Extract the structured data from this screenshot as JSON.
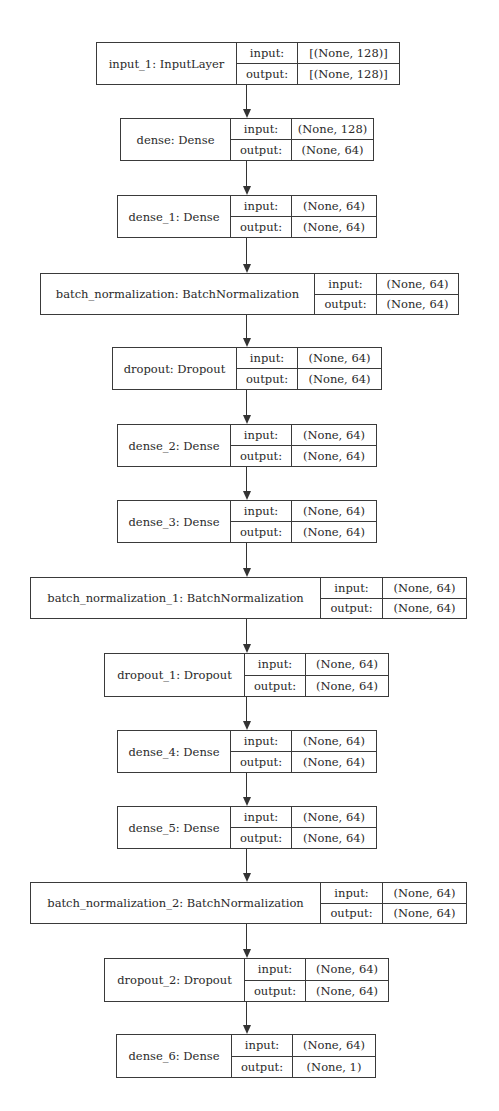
{
  "diagram": {
    "type": "keras_model_plot",
    "port_labels": {
      "input": "input:",
      "output": "output:"
    },
    "nodes": [
      {
        "id": "input_1",
        "label": "input_1: InputLayer",
        "input_shape": "[(None, 128)]",
        "output_shape": "[(None, 128)]"
      },
      {
        "id": "dense",
        "label": "dense: Dense",
        "input_shape": "(None, 128)",
        "output_shape": "(None, 64)"
      },
      {
        "id": "dense_1",
        "label": "dense_1: Dense",
        "input_shape": "(None, 64)",
        "output_shape": "(None, 64)"
      },
      {
        "id": "batch_normalization",
        "label": "batch_normalization: BatchNormalization",
        "input_shape": "(None, 64)",
        "output_shape": "(None, 64)"
      },
      {
        "id": "dropout",
        "label": "dropout: Dropout",
        "input_shape": "(None, 64)",
        "output_shape": "(None, 64)"
      },
      {
        "id": "dense_2",
        "label": "dense_2: Dense",
        "input_shape": "(None, 64)",
        "output_shape": "(None, 64)"
      },
      {
        "id": "dense_3",
        "label": "dense_3: Dense",
        "input_shape": "(None, 64)",
        "output_shape": "(None, 64)"
      },
      {
        "id": "batch_normalization_1",
        "label": "batch_normalization_1: BatchNormalization",
        "input_shape": "(None, 64)",
        "output_shape": "(None, 64)"
      },
      {
        "id": "dropout_1",
        "label": "dropout_1: Dropout",
        "input_shape": "(None, 64)",
        "output_shape": "(None, 64)"
      },
      {
        "id": "dense_4",
        "label": "dense_4: Dense",
        "input_shape": "(None, 64)",
        "output_shape": "(None, 64)"
      },
      {
        "id": "dense_5",
        "label": "dense_5: Dense",
        "input_shape": "(None, 64)",
        "output_shape": "(None, 64)"
      },
      {
        "id": "batch_normalization_2",
        "label": "batch_normalization_2: BatchNormalization",
        "input_shape": "(None, 64)",
        "output_shape": "(None, 64)"
      },
      {
        "id": "dropout_2",
        "label": "dropout_2: Dropout",
        "input_shape": "(None, 64)",
        "output_shape": "(None, 64)"
      },
      {
        "id": "dense_6",
        "label": "dense_6: Dense",
        "input_shape": "(None, 64)",
        "output_shape": "(None, 1)"
      }
    ],
    "edges": [
      [
        "input_1",
        "dense"
      ],
      [
        "dense",
        "dense_1"
      ],
      [
        "dense_1",
        "batch_normalization"
      ],
      [
        "batch_normalization",
        "dropout"
      ],
      [
        "dropout",
        "dense_2"
      ],
      [
        "dense_2",
        "dense_3"
      ],
      [
        "dense_3",
        "batch_normalization_1"
      ],
      [
        "batch_normalization_1",
        "dropout_1"
      ],
      [
        "dropout_1",
        "dense_4"
      ],
      [
        "dense_4",
        "dense_5"
      ],
      [
        "dense_5",
        "batch_normalization_2"
      ],
      [
        "batch_normalization_2",
        "dropout_2"
      ],
      [
        "dropout_2",
        "dense_6"
      ]
    ]
  }
}
